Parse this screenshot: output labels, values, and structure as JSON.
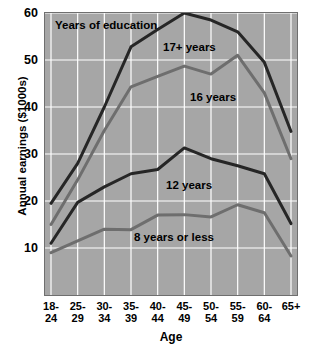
{
  "chart_data": {
    "type": "line",
    "title": "",
    "legend_title": "Years of education",
    "xlabel": "Age",
    "ylabel": "Annual earnings ($1000s)",
    "categories": [
      "18-\n24",
      "25-\n29",
      "30-\n34",
      "35-\n39",
      "40-\n44",
      "45-\n49",
      "50-\n54",
      "55-\n59",
      "60-\n64",
      "65+"
    ],
    "category_labels_flat": [
      "18-24",
      "25-29",
      "30-34",
      "35-39",
      "40-44",
      "45-49",
      "50-54",
      "55-59",
      "60-64",
      "65+"
    ],
    "ylim": [
      0,
      60
    ],
    "yticks": [
      10,
      20,
      30,
      40,
      50,
      60
    ],
    "ytick_labels": [
      "10",
      "20",
      "30",
      "40",
      "50",
      "60"
    ],
    "grid": true,
    "grid_color": "#ffffff",
    "plot_background": "#a6a6a6",
    "legend_position": "inline-annotations",
    "series": [
      {
        "name": "17+ years",
        "color": "#262626",
        "values": [
          19.5,
          28.0,
          40.0,
          52.8,
          56.5,
          60.0,
          58.5,
          56.0,
          49.5,
          34.8
        ]
      },
      {
        "name": "16 years",
        "color": "#6e6e6e",
        "values": [
          15.0,
          24.5,
          35.0,
          44.3,
          46.5,
          48.7,
          47.0,
          51.0,
          43.0,
          29.0
        ]
      },
      {
        "name": "12 years",
        "color": "#262626",
        "values": [
          11.0,
          19.7,
          23.0,
          25.8,
          26.7,
          31.3,
          29.0,
          27.5,
          25.8,
          15.2
        ]
      },
      {
        "name": "8 years or less",
        "color": "#6e6e6e",
        "values": [
          9.0,
          11.5,
          14.0,
          13.9,
          17.0,
          17.1,
          16.6,
          19.2,
          17.5,
          8.3
        ]
      }
    ],
    "annotations": [
      {
        "text": "Years of education",
        "series": null
      },
      {
        "text": "17+ years",
        "series": "17+ years"
      },
      {
        "text": "16 years",
        "series": "16 years"
      },
      {
        "text": "12 years",
        "series": "12 years"
      },
      {
        "text": "8 years or less",
        "series": "8 years or less"
      }
    ]
  }
}
